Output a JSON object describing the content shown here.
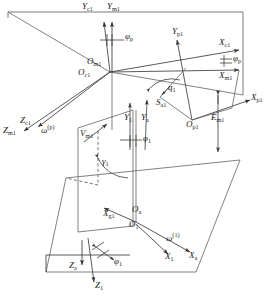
{
  "figure": {
    "type": "line-diagram",
    "width": 276,
    "height": 298,
    "stroke_color": "#4d4d4d",
    "text_color": "#1a1a1a",
    "background": "#ffffff"
  },
  "labels": {
    "y_c1": "Y",
    "y_c1_sub": "c1",
    "y_m1": "Y",
    "y_m1_sub": "m1",
    "phi_p_top": "φ",
    "phi_p_top_sub": "p",
    "y_p1": "Y",
    "y_p1_sub": "p1",
    "x_c1": "X",
    "x_c1_sub": "c1",
    "phi_p_right": "φ",
    "phi_p_right_sub": "p",
    "x_m1": "X",
    "x_m1_sub": "m1",
    "x_p1": "X",
    "x_p1_sub": "p1",
    "o_m1": "O",
    "o_m1_sub": "m1",
    "o_c1": "O",
    "o_c1_sub": "c1",
    "q_1": "q",
    "q_1_sub": "1",
    "s_a1": "S",
    "s_a1_sub": "a1",
    "y_1": "Y",
    "y_1_sub": "1",
    "y_a": "Y",
    "y_a_sub": "a",
    "o_p1": "O",
    "o_p1_sub": "p1",
    "e_m1": "E",
    "e_m1_sub": "m1",
    "z_c1": "Z",
    "z_c1_sub": "c1",
    "z_m1": "Z",
    "z_m1_sub": "m1",
    "omega_p": "ω",
    "omega_p_sup": "(p)",
    "v_m1": "V",
    "v_m1_sub": "m1",
    "phi_1_mid": "φ",
    "phi_1_mid_sub": "1",
    "gamma_1": "γ",
    "gamma_1_sub": "1",
    "x_g1": "X",
    "x_g1_sub": "g1",
    "o_a": "O",
    "o_a_sub": "a",
    "o_1": "O",
    "o_1_sub": "1",
    "omega_1": "ω",
    "omega_1_sup": "(1)",
    "x_1": "X",
    "x_1_sub": "1",
    "x_a": "X",
    "x_a_sub": "a",
    "z_a": "Z",
    "z_a_sub": "a",
    "z_1": "Z",
    "z_1_sub": "1",
    "phi_1_bottom": "φ",
    "phi_1_bottom_sub": "1"
  }
}
